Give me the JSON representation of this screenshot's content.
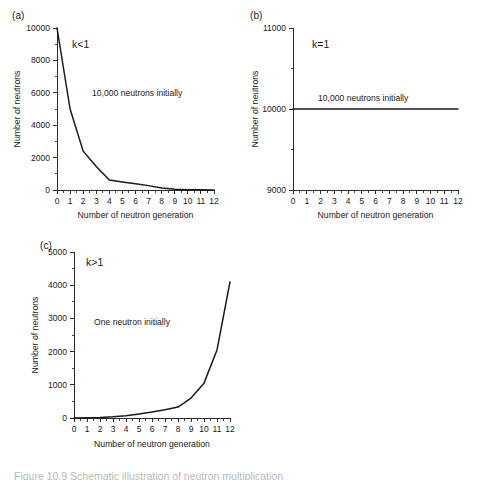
{
  "figure": {
    "caption": "Figure 10.9  Schematic illustration of neutron multiplication"
  },
  "panels": [
    {
      "letter": "(a)",
      "k_label": "k<1",
      "annotation": "10,000 neutrons initially"
    },
    {
      "letter": "(b)",
      "k_label": "k=1",
      "annotation": "10,000 neutrons initially"
    },
    {
      "letter": "(c)",
      "k_label": "k>1",
      "annotation": "One neutron initially"
    }
  ],
  "chart_data": [
    {
      "type": "line",
      "panel": "(a)",
      "title": "",
      "xlabel": "Number of neutron generation",
      "ylabel": "Number of neutrons",
      "xlim": [
        0,
        12
      ],
      "ylim": [
        0,
        10000
      ],
      "xticks": [
        0,
        1,
        2,
        3,
        4,
        5,
        6,
        7,
        8,
        9,
        10,
        11,
        12
      ],
      "xticklabels": [
        "0",
        "1",
        "2",
        "3",
        "4",
        "5",
        "6",
        "7",
        "8",
        "9",
        "10",
        "11",
        "12"
      ],
      "yticks": [
        0,
        2000,
        4000,
        6000,
        8000,
        10000
      ],
      "yticklabels": [
        "0",
        "2000",
        "4000",
        "6000",
        "8000",
        "10000"
      ],
      "grid": false,
      "legend": "none",
      "annotations": [
        "k<1",
        "10,000 neutrons initially"
      ],
      "x": [
        0,
        1,
        2,
        3,
        4,
        5,
        6,
        7,
        8,
        9,
        10,
        11,
        12
      ],
      "values": [
        10000,
        5000,
        2400,
        1450,
        620,
        500,
        390,
        270,
        120,
        40,
        20,
        10,
        5
      ]
    },
    {
      "type": "line",
      "panel": "(b)",
      "title": "",
      "xlabel": "Number of neutron generation",
      "ylabel": "Number of neutrons",
      "xlim": [
        0,
        12
      ],
      "ylim": [
        9000,
        11000
      ],
      "xticks": [
        0,
        1,
        2,
        3,
        4,
        5,
        6,
        7,
        8,
        9,
        10,
        11,
        12
      ],
      "xticklabels": [
        "0",
        "1",
        "2",
        "3",
        "4",
        "5",
        "6",
        "7",
        "8",
        "9",
        "10",
        "11",
        "12"
      ],
      "yticks": [
        9000,
        10000,
        11000
      ],
      "yticklabels": [
        "9000",
        "10000",
        "11000"
      ],
      "grid": false,
      "legend": "none",
      "annotations": [
        "k=1",
        "10,000 neutrons initially"
      ],
      "x": [
        0,
        1,
        2,
        3,
        4,
        5,
        6,
        7,
        8,
        9,
        10,
        11,
        12
      ],
      "values": [
        10000,
        10000,
        10000,
        10000,
        10000,
        10000,
        10000,
        10000,
        10000,
        10000,
        10000,
        10000,
        10000
      ]
    },
    {
      "type": "line",
      "panel": "(c)",
      "title": "",
      "xlabel": "Number of neutron generation",
      "ylabel": "Number of neutrons",
      "xlim": [
        0,
        12
      ],
      "ylim": [
        0,
        5000
      ],
      "xticks": [
        0,
        1,
        2,
        3,
        4,
        5,
        6,
        7,
        8,
        9,
        10,
        11,
        12
      ],
      "xticklabels": [
        "0",
        "1",
        "2",
        "3",
        "4",
        "5",
        "6",
        "7",
        "8",
        "9",
        "10",
        "11",
        "12"
      ],
      "yticks": [
        0,
        1000,
        2000,
        3000,
        4000,
        5000
      ],
      "yticklabels": [
        "0",
        "1000",
        "2000",
        "3000",
        "4000",
        "5000"
      ],
      "grid": false,
      "legend": "none",
      "annotations": [
        "k>1",
        "One neutron initially"
      ],
      "x": [
        0,
        1,
        2,
        3,
        4,
        5,
        6,
        7,
        8,
        9,
        10,
        11,
        12
      ],
      "values": [
        1,
        5,
        15,
        35,
        70,
        120,
        180,
        250,
        330,
        600,
        1050,
        2050,
        4100
      ]
    }
  ]
}
